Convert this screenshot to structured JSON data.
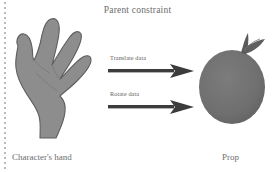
{
  "figure": {
    "title": "Parent constraint",
    "background_color": "#ffffff",
    "text_color": "#6d6d6d"
  },
  "objects": {
    "hand": {
      "caption": "Character's hand",
      "icon": "hand-silhouette-icon",
      "fill_color": "#8d8d8d",
      "outline_color": "#5e5e5e"
    },
    "prop": {
      "caption": "Prop",
      "icon": "apple-silhouette-icon",
      "fill_color": "#6f6f6f",
      "stem_color": "#5a5a5a"
    }
  },
  "arrows": [
    {
      "label": "Translate data",
      "icon": "arrow-right-icon",
      "color": "#3c3c3c",
      "direction": "right"
    },
    {
      "label": "Rotate data",
      "icon": "arrow-right-icon",
      "color": "#3c3c3c",
      "direction": "right"
    }
  ],
  "decorations": {
    "spine": {
      "icon": "dotted-line-icon",
      "color": "#b9b9b9"
    }
  }
}
